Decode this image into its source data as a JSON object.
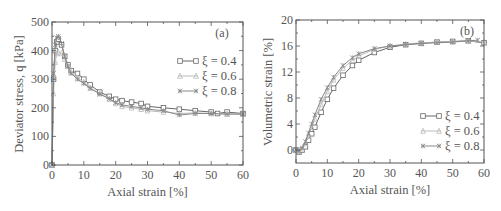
{
  "chart_data": [
    {
      "type": "line",
      "panel_label": "(a)",
      "title": "",
      "xlabel": "Axial strain [%]",
      "ylabel": "Deviator stress, q [kPa]",
      "xlim": [
        0,
        60
      ],
      "ylim": [
        0,
        500
      ],
      "xticks": [
        "0",
        "10",
        "20",
        "30",
        "40",
        "50",
        "60"
      ],
      "yticks": [
        "0",
        "100",
        "200",
        "300",
        "400",
        "500"
      ],
      "grid": false,
      "legend_position": "upper right",
      "series": [
        {
          "name": "ξ = 0.4",
          "marker": "square",
          "x": [
            0,
            0.5,
            1,
            1.5,
            2,
            3,
            4,
            5,
            6,
            8,
            10,
            12,
            15,
            18,
            20,
            22,
            25,
            28,
            30,
            35,
            40,
            45,
            50,
            52,
            55,
            60
          ],
          "y": [
            0,
            300,
            400,
            430,
            440,
            420,
            380,
            350,
            330,
            320,
            300,
            280,
            255,
            240,
            230,
            225,
            220,
            215,
            205,
            200,
            195,
            190,
            185,
            180,
            185,
            180
          ]
        },
        {
          "name": "ξ = 0.6",
          "marker": "triangle",
          "x": [
            0,
            0.5,
            1,
            1.5,
            2,
            3,
            4,
            5,
            6,
            8,
            10,
            12,
            15,
            18,
            20,
            22,
            25,
            28,
            30,
            35,
            40,
            45,
            50,
            55,
            60
          ],
          "y": [
            0,
            250,
            360,
            390,
            395,
            390,
            370,
            345,
            325,
            305,
            290,
            270,
            250,
            230,
            215,
            205,
            200,
            195,
            190,
            185,
            180,
            182,
            180,
            178,
            178
          ]
        },
        {
          "name": "ξ = 0.8",
          "marker": "asterisk",
          "x": [
            0,
            0.5,
            1,
            1.5,
            2,
            3,
            4,
            5,
            6,
            8,
            10,
            12,
            15,
            18,
            20,
            22,
            25,
            28,
            30,
            35,
            40,
            45,
            50,
            55,
            60
          ],
          "y": [
            0,
            320,
            420,
            445,
            450,
            425,
            380,
            345,
            320,
            300,
            285,
            268,
            248,
            232,
            218,
            210,
            205,
            200,
            195,
            190,
            175,
            180,
            180,
            178,
            178
          ]
        }
      ]
    },
    {
      "type": "line",
      "panel_label": "(b)",
      "title": "",
      "xlabel": "Axial strain [%]",
      "ylabel": "Volumetric strain [%]",
      "xlim": [
        0,
        60
      ],
      "ylim": [
        -2,
        20
      ],
      "xticks": [
        "0",
        "10",
        "20",
        "30",
        "40",
        "50",
        "60"
      ],
      "yticks": [
        "0",
        "4",
        "8",
        "12",
        "16",
        "20"
      ],
      "grid": false,
      "legend_position": "lower right",
      "series": [
        {
          "name": "ξ = 0.4",
          "marker": "square",
          "x": [
            0,
            1,
            2,
            3,
            4,
            5,
            6,
            8,
            10,
            12,
            15,
            18,
            20,
            25,
            30,
            35,
            40,
            45,
            50,
            55,
            60
          ],
          "y": [
            0,
            -0.3,
            0,
            0.5,
            1.5,
            2.5,
            3.5,
            5.8,
            7.8,
            9.5,
            11.5,
            13,
            13.8,
            15,
            15.8,
            16.2,
            16.4,
            16.6,
            16.7,
            16.8,
            16.5
          ]
        },
        {
          "name": "ξ = 0.6",
          "marker": "triangle",
          "x": [
            0,
            1,
            2,
            3,
            4,
            5,
            6,
            8,
            10,
            12,
            15,
            18,
            20,
            25,
            30,
            35,
            40,
            45,
            50,
            55,
            60
          ],
          "y": [
            0,
            -0.2,
            0.2,
            1,
            2.2,
            3.5,
            4.8,
            7,
            9,
            10.8,
            12.6,
            13.8,
            14.5,
            15.5,
            16,
            16.3,
            16.5,
            16.6,
            16.7,
            16.8,
            16.6
          ]
        },
        {
          "name": "ξ = 0.8",
          "marker": "asterisk",
          "x": [
            0,
            1,
            2,
            3,
            4,
            5,
            6,
            8,
            10,
            12,
            15,
            18,
            20,
            25,
            30,
            35,
            40,
            45,
            50,
            55,
            58
          ],
          "y": [
            0,
            -0.2,
            0.3,
            1.3,
            2.6,
            4,
            5.4,
            7.8,
            9.6,
            11.2,
            13,
            14.2,
            14.8,
            15.6,
            16,
            16.2,
            16.4,
            16.5,
            16.6,
            16.8,
            16.9
          ]
        }
      ]
    }
  ],
  "colors": {
    "axis": "#555555",
    "series_0_4": "#666666",
    "series_0_6": "#bbbbbb",
    "series_0_8": "#888888"
  }
}
